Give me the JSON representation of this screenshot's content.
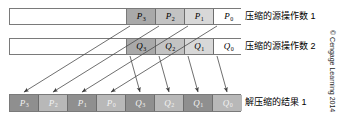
{
  "figure": {
    "credit": "© Cengage Learning 2014"
  },
  "rows": {
    "packed_operand_1": {
      "caption": "压缩的源操作数 1",
      "cells": [
        {
          "base": "P",
          "sub": "3",
          "shade": "sh-dark"
        },
        {
          "base": "P",
          "sub": "2",
          "shade": "sh-mid"
        },
        {
          "base": "P",
          "sub": "1",
          "shade": "sh-light"
        },
        {
          "base": "P",
          "sub": "0",
          "shade": "sh-white"
        }
      ]
    },
    "packed_operand_2": {
      "caption": "压缩的源操作数 2",
      "cells": [
        {
          "base": "Q",
          "sub": "3",
          "shade": "sh-dark"
        },
        {
          "base": "Q",
          "sub": "2",
          "shade": "sh-mid"
        },
        {
          "base": "Q",
          "sub": "1",
          "shade": "sh-light"
        },
        {
          "base": "Q",
          "sub": "0",
          "shade": "sh-white"
        }
      ]
    },
    "unpacked_result": {
      "caption": "解压缩的结果 1",
      "cells": [
        {
          "base": "P",
          "sub": "3",
          "shade": "sh-rdark"
        },
        {
          "base": "P",
          "sub": "2",
          "shade": "sh-rlight"
        },
        {
          "base": "P",
          "sub": "1",
          "shade": "sh-rdark"
        },
        {
          "base": "P",
          "sub": "0",
          "shade": "sh-rlight"
        },
        {
          "base": "Q",
          "sub": "3",
          "shade": "sh-rdark"
        },
        {
          "base": "Q",
          "sub": "2",
          "shade": "sh-rlight"
        },
        {
          "base": "Q",
          "sub": "1",
          "shade": "sh-rdark"
        },
        {
          "base": "Q",
          "sub": "0",
          "shade": "sh-rlight"
        }
      ]
    }
  },
  "arrows": [
    {
      "name": "arrow-p3",
      "x1": 130,
      "y1": 26,
      "x2": 24,
      "y2": 92
    },
    {
      "name": "arrow-p2",
      "x1": 159,
      "y1": 26,
      "x2": 53,
      "y2": 92
    },
    {
      "name": "arrow-p1",
      "x1": 188,
      "y1": 26,
      "x2": 82,
      "y2": 92
    },
    {
      "name": "arrow-p0",
      "x1": 217,
      "y1": 26,
      "x2": 111,
      "y2": 92
    },
    {
      "name": "arrow-q3",
      "x1": 130,
      "y1": 56,
      "x2": 140,
      "y2": 92
    },
    {
      "name": "arrow-q2",
      "x1": 159,
      "y1": 56,
      "x2": 169,
      "y2": 92
    },
    {
      "name": "arrow-q1",
      "x1": 188,
      "y1": 56,
      "x2": 198,
      "y2": 92
    },
    {
      "name": "arrow-q0",
      "x1": 217,
      "y1": 56,
      "x2": 227,
      "y2": 92
    }
  ],
  "colors": {
    "stroke": "#4a4a4a",
    "border": "#7a7a7a"
  }
}
